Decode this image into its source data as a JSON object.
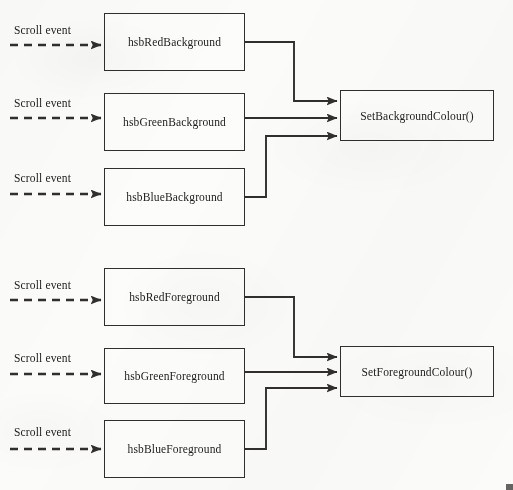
{
  "diagram": {
    "type": "flow-diagram",
    "canvas": {
      "width": 513,
      "height": 490
    },
    "colors": {
      "stroke": "#302f2d",
      "text": "#1d1c1b",
      "box_fill": "#fcfcfb",
      "page_background": "#fbfbfa"
    },
    "groups": [
      {
        "name": "background-group",
        "target": {
          "id": "set-background-colour",
          "label": "SetBackgroundColour()",
          "x": 340,
          "y": 90,
          "width": 154,
          "height": 51
        },
        "sources": [
          {
            "id": "hsb-red-background",
            "label": "hsbRedBackground",
            "event_label": "Scroll event",
            "x": 104,
            "y": 13,
            "width": 141,
            "height": 58,
            "event_label_x": 14,
            "event_label_y": 24,
            "dashed_arrow": {
              "x1": 10,
              "y1": 45,
              "x2": 102,
              "y2": 45
            },
            "arrow_target_y": 101,
            "route": "right-down-right"
          },
          {
            "id": "hsb-green-background",
            "label": "hsbGreenBackground",
            "event_label": "Scroll event",
            "x": 104,
            "y": 93,
            "width": 141,
            "height": 58,
            "event_label_x": 14,
            "event_label_y": 97,
            "dashed_arrow": {
              "x1": 10,
              "y1": 118,
              "x2": 102,
              "y2": 118
            },
            "arrow_target_y": 118,
            "route": "straight"
          },
          {
            "id": "hsb-blue-background",
            "label": "hsbBlueBackground",
            "event_label": "Scroll event",
            "x": 104,
            "y": 168,
            "width": 141,
            "height": 58,
            "event_label_x": 14,
            "event_label_y": 172,
            "dashed_arrow": {
              "x1": 10,
              "y1": 194,
              "x2": 102,
              "y2": 194
            },
            "arrow_target_y": 136,
            "route": "right-up-right"
          }
        ]
      },
      {
        "name": "foreground-group",
        "target": {
          "id": "set-foreground-colour",
          "label": "SetForegroundColour()",
          "x": 340,
          "y": 346,
          "width": 154,
          "height": 51
        },
        "sources": [
          {
            "id": "hsb-red-foreground",
            "label": "hsbRedForeground",
            "event_label": "Scroll event",
            "x": 104,
            "y": 268,
            "width": 141,
            "height": 58,
            "event_label_x": 14,
            "event_label_y": 279,
            "dashed_arrow": {
              "x1": 10,
              "y1": 300,
              "x2": 102,
              "y2": 300
            },
            "arrow_target_y": 357,
            "route": "right-down-right"
          },
          {
            "id": "hsb-green-foreground",
            "label": "hsbGreenForeground",
            "event_label": "Scroll event",
            "x": 104,
            "y": 348,
            "width": 141,
            "height": 56,
            "event_label_x": 14,
            "event_label_y": 352,
            "dashed_arrow": {
              "x1": 10,
              "y1": 374,
              "x2": 102,
              "y2": 374
            },
            "arrow_target_y": 372,
            "route": "straight"
          },
          {
            "id": "hsb-blue-foreground",
            "label": "hsbBlueForeground",
            "event_label": "Scroll event",
            "x": 104,
            "y": 420,
            "width": 141,
            "height": 58,
            "event_label_x": 14,
            "event_label_y": 426,
            "dashed_arrow": {
              "x1": 10,
              "y1": 449,
              "x2": 102,
              "y2": 449
            },
            "arrow_target_y": 388,
            "route": "right-up-right"
          }
        ]
      }
    ]
  }
}
